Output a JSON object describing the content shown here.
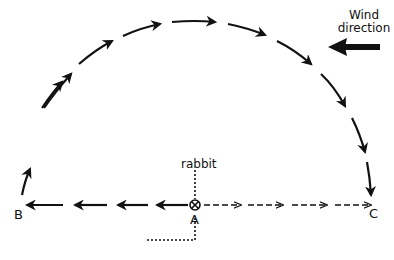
{
  "diagram": {
    "labels": {
      "rabbit": "rabbit",
      "point_a": "A",
      "point_b": "B",
      "point_c": "C",
      "wind_line1": "Wind",
      "wind_line2": "direction"
    },
    "colors": {
      "ink": "#111111",
      "background": "#ffffff"
    },
    "paths": [
      {
        "name": "arc-path",
        "style": "solid-arrows",
        "from": "B",
        "to": "C",
        "direction": "clockwise over top"
      },
      {
        "name": "straight-return-path",
        "style": "solid-arrows",
        "from": "A",
        "to": "B"
      },
      {
        "name": "dashed-path",
        "style": "dashed-arrows",
        "from": "A",
        "to": "C"
      },
      {
        "name": "rabbit-track",
        "style": "dotted",
        "through": "A"
      }
    ],
    "wind_arrow": {
      "direction": "left"
    }
  }
}
